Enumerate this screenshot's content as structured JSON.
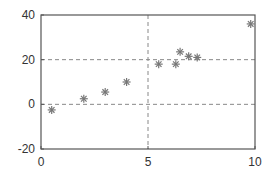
{
  "chart_data": {
    "type": "scatter",
    "title": "",
    "xlabel": "",
    "ylabel": "",
    "xlim": [
      0,
      10
    ],
    "ylim": [
      -20,
      40
    ],
    "xticks": [
      0,
      5,
      10
    ],
    "yticks": [
      -20,
      0,
      20,
      40
    ],
    "xtick_labels": [
      "0",
      "5",
      "10"
    ],
    "ytick_labels": [
      "-20",
      "0",
      "20",
      "40"
    ],
    "grid": {
      "x": [
        5
      ],
      "y": [
        0,
        20
      ],
      "style": "dashed"
    },
    "legend": null,
    "marker": "asterisk",
    "marker_color": "#777777",
    "series": [
      {
        "name": "data",
        "x": [
          0.5,
          2.0,
          3.0,
          4.0,
          5.5,
          6.3,
          6.5,
          6.9,
          7.3,
          9.8
        ],
        "y": [
          -2.5,
          2.5,
          5.5,
          10.0,
          18.0,
          18.0,
          23.5,
          21.5,
          21.0,
          36.0
        ]
      }
    ]
  }
}
